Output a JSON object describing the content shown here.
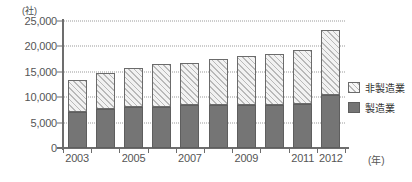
{
  "chart_data": {
    "type": "bar",
    "subtype": "stacked-vertical",
    "title": "",
    "xlabel": "(年)",
    "ylabel": "(社)",
    "unit_label_y": "(社)",
    "unit_label_x": "(年)",
    "categories": [
      "2003",
      "2004",
      "2005",
      "2006",
      "2007",
      "2008",
      "2009",
      "2010",
      "2011",
      "2012"
    ],
    "x_tick_labels": [
      "2003",
      "2005",
      "2007",
      "2009",
      "2011",
      "2012"
    ],
    "y_tick_labels": [
      "0",
      "5,000",
      "10,000",
      "15,000",
      "20,000",
      "25,000"
    ],
    "y_ticks": [
      0,
      5000,
      10000,
      15000,
      20000,
      25000
    ],
    "ylim": [
      0,
      25000
    ],
    "grid": true,
    "grid_axis": "y",
    "legend_position": "right",
    "series": [
      {
        "name": "製造業",
        "key": "mfg",
        "color": "#757575",
        "pattern": "solid",
        "values": [
          7100,
          7700,
          8000,
          8100,
          8400,
          8500,
          8400,
          8400,
          8700,
          10500
        ]
      },
      {
        "name": "非製造業",
        "key": "nonmfg",
        "color": "#f2f2f2",
        "pattern": "diagonal-hatch",
        "values": [
          6300,
          7100,
          7800,
          8400,
          8400,
          9100,
          9700,
          10100,
          10500,
          12700
        ]
      }
    ],
    "totals": [
      13400,
      14800,
      15800,
      16500,
      16800,
      17600,
      18100,
      18500,
      19200,
      23200
    ]
  },
  "legend": {
    "items": [
      {
        "label": "非製造業",
        "key": "nonmfg"
      },
      {
        "label": "製造業",
        "key": "mfg"
      }
    ]
  }
}
